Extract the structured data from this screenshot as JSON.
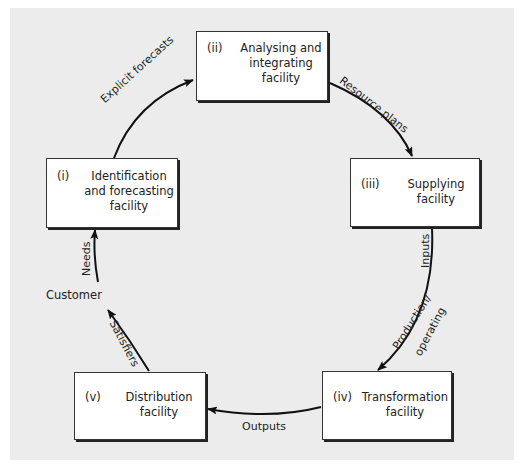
{
  "diagram": {
    "type": "cycle",
    "background_color": "#ececec",
    "nodes": [
      {
        "id": "i",
        "number": "(i)",
        "lines": [
          "Identification",
          "and forecasting",
          "facility"
        ]
      },
      {
        "id": "ii",
        "number": "(ii)",
        "lines": [
          "Analysing and",
          "integrating",
          "facility"
        ]
      },
      {
        "id": "iii",
        "number": "(iii)",
        "lines": [
          "Supplying",
          "facility"
        ]
      },
      {
        "id": "iv",
        "number": "(iv)",
        "lines": [
          "Transformation",
          "facility"
        ]
      },
      {
        "id": "v",
        "number": "(v)",
        "lines": [
          "Distribution",
          "facility"
        ]
      }
    ],
    "customer": "Customer",
    "edges": [
      {
        "from": "i",
        "to": "ii",
        "label": "Explicit forecasts"
      },
      {
        "from": "ii",
        "to": "iii",
        "label": "Resource plans"
      },
      {
        "from": "iii",
        "to": "iv",
        "label_1": "Inputs",
        "label_2": "Production/",
        "label_3": "operating"
      },
      {
        "from": "iv",
        "to": "v",
        "label": "Outputs"
      },
      {
        "from": "v",
        "to": "customer",
        "label": "Satisfiers"
      },
      {
        "from": "customer",
        "to": "i",
        "label": "Needs"
      }
    ]
  }
}
